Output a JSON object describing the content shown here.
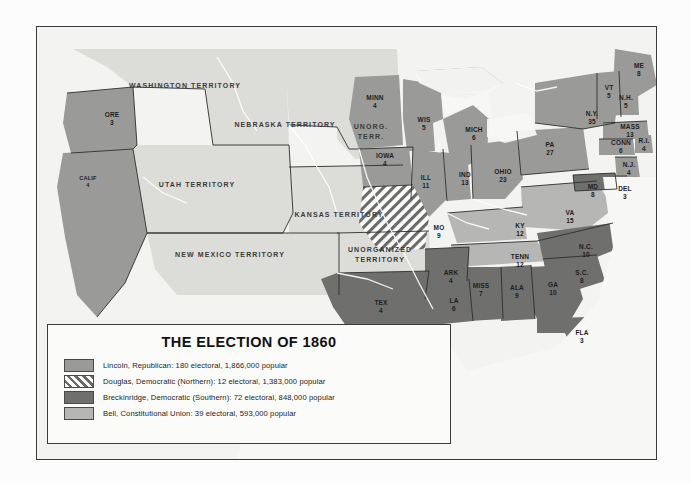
{
  "legend": {
    "title": "THE ELECTION OF 1860",
    "entries": [
      {
        "swatch": "lincoln",
        "label": "Lincoln, Republican: 180 electoral, 1,866,000 popular"
      },
      {
        "swatch": "douglas",
        "label": "Douglas, Democratic (Northern): 12 electoral, 1,383,000 popular"
      },
      {
        "swatch": "breckinridge",
        "label": "Breckinridge, Democratic (Southern): 72 electoral, 848,000 popular"
      },
      {
        "swatch": "bell",
        "label": "Bell, Constitutional Union: 39 electoral, 593,000 popular"
      }
    ]
  },
  "colors": {
    "lincoln": "#9a9a99",
    "douglas": "#6a6a69",
    "breckinridge": "#6f6f6e",
    "bell": "#b6b6b4",
    "territory": "#dcdcd8",
    "frame": "#3a3a3a"
  },
  "territories": [
    {
      "name": "WASHINGTON TERRITORY",
      "x": 148,
      "y": 58
    },
    {
      "name": "NEBRASKA TERRITORY",
      "x": 248,
      "y": 97
    },
    {
      "name": "UNORG.\nTERR.",
      "x": 334,
      "y": 105
    },
    {
      "name": "UTAH TERRITORY",
      "x": 160,
      "y": 157
    },
    {
      "name": "KANSAS TERRITORY",
      "x": 302,
      "y": 187
    },
    {
      "name": "NEW MEXICO TERRITORY",
      "x": 193,
      "y": 227
    },
    {
      "name": "UNORGANIZED\nTERRITORY",
      "x": 343,
      "y": 228
    }
  ],
  "states": [
    {
      "abbr": "ORE",
      "ev": "3",
      "x": 75,
      "y": 92,
      "party": "lincoln"
    },
    {
      "abbr": "CALIF",
      "ev": "4",
      "x": 51,
      "y": 155,
      "party": "lincoln"
    },
    {
      "abbr": "MINN",
      "ev": "4",
      "x": 338,
      "y": 75,
      "party": "lincoln"
    },
    {
      "abbr": "WIS",
      "ev": "5",
      "x": 387,
      "y": 97,
      "party": "lincoln"
    },
    {
      "abbr": "MICH",
      "ev": "6",
      "x": 437,
      "y": 107,
      "party": "lincoln"
    },
    {
      "abbr": "IOWA",
      "ev": "4",
      "x": 348,
      "y": 133,
      "party": "lincoln"
    },
    {
      "abbr": "ILL",
      "ev": "11",
      "x": 389,
      "y": 155,
      "party": "lincoln"
    },
    {
      "abbr": "IND",
      "ev": "13",
      "x": 428,
      "y": 152,
      "party": "lincoln"
    },
    {
      "abbr": "OHIO",
      "ev": "23",
      "x": 466,
      "y": 149,
      "party": "lincoln"
    },
    {
      "abbr": "PA",
      "ev": "27",
      "x": 513,
      "y": 122,
      "party": "lincoln"
    },
    {
      "abbr": "N.Y.",
      "ev": "35",
      "x": 555,
      "y": 91,
      "party": "lincoln"
    },
    {
      "abbr": "ME",
      "ev": "8",
      "x": 602,
      "y": 43,
      "party": "lincoln"
    },
    {
      "abbr": "VT",
      "ev": "5",
      "x": 572,
      "y": 65,
      "party": "lincoln"
    },
    {
      "abbr": "N.H.",
      "ev": "5",
      "x": 589,
      "y": 75,
      "party": "lincoln"
    },
    {
      "abbr": "MASS",
      "ev": "13",
      "x": 593,
      "y": 104,
      "party": "lincoln"
    },
    {
      "abbr": "CONN",
      "ev": "6",
      "x": 584,
      "y": 120,
      "party": "lincoln"
    },
    {
      "abbr": "R.I.",
      "ev": "4",
      "x": 607,
      "y": 118,
      "party": "lincoln"
    },
    {
      "abbr": "N.J.",
      "ev": "4",
      "x": 592,
      "y": 142,
      "party": "lincoln"
    },
    {
      "abbr": "DEL",
      "ev": "3",
      "x": 588,
      "y": 166,
      "party": "breckinridge"
    },
    {
      "abbr": "MD",
      "ev": "8",
      "x": 556,
      "y": 164,
      "party": "breckinridge"
    },
    {
      "abbr": "VA",
      "ev": "15",
      "x": 533,
      "y": 190,
      "party": "bell"
    },
    {
      "abbr": "KY",
      "ev": "12",
      "x": 483,
      "y": 203,
      "party": "bell"
    },
    {
      "abbr": "MO",
      "ev": "9",
      "x": 402,
      "y": 205,
      "party": "douglas"
    },
    {
      "abbr": "TENN",
      "ev": "12",
      "x": 483,
      "y": 234,
      "party": "bell"
    },
    {
      "abbr": "N.C.",
      "ev": "10",
      "x": 549,
      "y": 224,
      "party": "breckinridge"
    },
    {
      "abbr": "S.C.",
      "ev": "8",
      "x": 545,
      "y": 250,
      "party": "breckinridge"
    },
    {
      "abbr": "GA",
      "ev": "10",
      "x": 516,
      "y": 262,
      "party": "breckinridge"
    },
    {
      "abbr": "ALA",
      "ev": "9",
      "x": 480,
      "y": 265,
      "party": "breckinridge"
    },
    {
      "abbr": "MISS",
      "ev": "7",
      "x": 444,
      "y": 263,
      "party": "breckinridge"
    },
    {
      "abbr": "ARK",
      "ev": "4",
      "x": 414,
      "y": 250,
      "party": "breckinridge"
    },
    {
      "abbr": "LA",
      "ev": "6",
      "x": 417,
      "y": 278,
      "party": "breckinridge"
    },
    {
      "abbr": "TEX",
      "ev": "4",
      "x": 344,
      "y": 280,
      "party": "breckinridge"
    },
    {
      "abbr": "FLA",
      "ev": "3",
      "x": 545,
      "y": 310,
      "party": "breckinridge"
    }
  ]
}
